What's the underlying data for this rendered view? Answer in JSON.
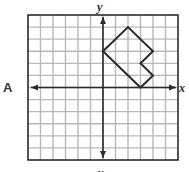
{
  "figure": {
    "panel_label": "A",
    "x_axis_label": "x",
    "y_axis_label_top": "y",
    "y_axis_label_bottom": "y",
    "grid": {
      "x_min": -6,
      "x_max": 6,
      "y_min": -6,
      "y_max": 6,
      "step": 1
    },
    "shape": {
      "type": "polygon",
      "vertices": [
        {
          "x": 0,
          "y": 3
        },
        {
          "x": 2,
          "y": 5
        },
        {
          "x": 4,
          "y": 3
        },
        {
          "x": 3,
          "y": 2
        },
        {
          "x": 4,
          "y": 1
        },
        {
          "x": 3,
          "y": 0
        }
      ]
    },
    "colors": {
      "grid_line": "#b8b8b8",
      "border": "#2b2b2b",
      "axis": "#2b2b2b",
      "shape_stroke": "#2b2b2b",
      "background": "#ffffff"
    }
  }
}
